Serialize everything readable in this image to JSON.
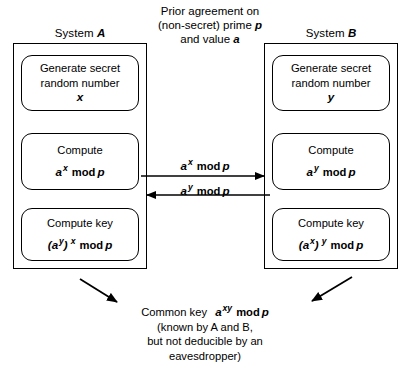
{
  "diagram": {
    "title_hint": "Diffie-Hellman key exchange",
    "header_note": {
      "line1": "Prior agreement on",
      "line2_pre": "(non-secret) prime",
      "line2_var": "p",
      "line3_pre": "and value",
      "line3_var": "a"
    },
    "systems": [
      {
        "id": "system-a",
        "title_pre": "System",
        "title_var": "A",
        "steps": [
          {
            "id": "generate-secret-a",
            "line1": "Generate secret",
            "line2": "random number",
            "value": "x"
          },
          {
            "id": "compute-a",
            "line1": "Compute",
            "base": "a",
            "exponent": "x",
            "mod": "mod",
            "modulus": "p"
          },
          {
            "id": "compute-key-a",
            "line1": "Compute key",
            "inner_open": "(a",
            "inner_exp": "y",
            "inner_close": ")",
            "outer_exp": "x",
            "mod": "mod",
            "modulus": "p"
          }
        ]
      },
      {
        "id": "system-b",
        "title_pre": "System",
        "title_var": "B",
        "steps": [
          {
            "id": "generate-secret-b",
            "line1": "Generate secret",
            "line2": "random number",
            "value": "y"
          },
          {
            "id": "compute-b",
            "line1": "Compute",
            "base": "a",
            "exponent": "y",
            "mod": "mod",
            "modulus": "p"
          },
          {
            "id": "compute-key-b",
            "line1": "Compute key",
            "inner_open": "(a",
            "inner_exp": "x",
            "inner_close": ")",
            "outer_exp": "y",
            "mod": "mod",
            "modulus": "p"
          }
        ]
      }
    ],
    "exchange": [
      {
        "id": "a-to-b",
        "base": "a",
        "exponent": "x",
        "mod": "mod",
        "modulus": "p",
        "direction": "right"
      },
      {
        "id": "b-to-a",
        "base": "a",
        "exponent": "y",
        "mod": "mod",
        "modulus": "p",
        "direction": "left"
      }
    ],
    "result": {
      "label": "Common key",
      "base": "a",
      "exponent": "xy",
      "mod": "mod",
      "modulus": "p",
      "note_line1": "(known by A and B,",
      "note_line2": "but not deducible by an",
      "note_line3": "eavesdropper)"
    },
    "colors": {
      "stroke": "#000000",
      "background": "#ffffff"
    }
  }
}
